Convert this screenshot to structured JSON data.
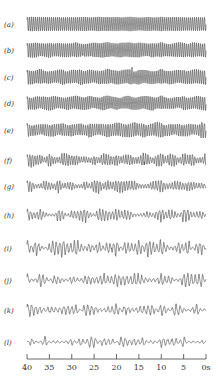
{
  "chart_data": {
    "type": "line",
    "title": "",
    "xlabel": "",
    "ylabel": "",
    "x_unit": "s",
    "xlim": [
      40,
      0
    ],
    "x_ticks": [
      40,
      35,
      30,
      25,
      20,
      15,
      10,
      5,
      0
    ],
    "x_tick_labels": [
      "40",
      "35",
      "30",
      "25",
      "20",
      "15",
      "10",
      "5",
      "0s"
    ],
    "grid": false,
    "series": [
      {
        "name": "(a)",
        "character": "regular",
        "amplitude": 1.0,
        "period_s": 0.45,
        "modulation": 0.05,
        "irregularity": 0.0
      },
      {
        "name": "(b)",
        "character": "regular",
        "amplitude": 1.0,
        "period_s": 0.45,
        "modulation": 0.1,
        "irregularity": 0.15
      },
      {
        "name": "(c)",
        "character": "regular",
        "amplitude": 1.0,
        "period_s": 0.45,
        "modulation": 0.15,
        "irregularity": 0.3
      },
      {
        "name": "(d)",
        "character": "regular",
        "amplitude": 0.9,
        "period_s": 0.45,
        "modulation": 0.15,
        "irregularity": 0.35
      },
      {
        "name": "(e)",
        "character": "regular",
        "amplitude": 0.9,
        "period_s": 0.5,
        "modulation": 0.2,
        "irregularity": 0.4
      },
      {
        "name": "(f)",
        "character": "irregular",
        "amplitude": 0.65,
        "period_s": 0.55,
        "modulation": 0.5,
        "irregularity": 0.6
      },
      {
        "name": "(g)",
        "character": "irregular",
        "amplitude": 0.6,
        "period_s": 0.6,
        "modulation": 0.6,
        "irregularity": 0.7
      },
      {
        "name": "(h)",
        "character": "irregular",
        "amplitude": 0.6,
        "period_s": 0.7,
        "modulation": 0.75,
        "irregularity": 0.7
      },
      {
        "name": "(i)",
        "character": "irregular",
        "amplitude": 0.7,
        "period_s": 0.8,
        "modulation": 0.85,
        "irregularity": 0.7
      },
      {
        "name": "(j)",
        "character": "irregular",
        "amplitude": 0.55,
        "period_s": 0.85,
        "modulation": 0.85,
        "irregularity": 0.7
      },
      {
        "name": "(k)",
        "character": "irregular",
        "amplitude": 0.5,
        "period_s": 0.9,
        "modulation": 0.85,
        "irregularity": 0.7
      },
      {
        "name": "(l)",
        "character": "irregular",
        "amplitude": 0.45,
        "period_s": 0.95,
        "modulation": 0.85,
        "irregularity": 0.7
      }
    ]
  }
}
